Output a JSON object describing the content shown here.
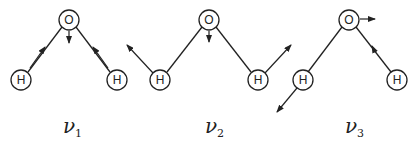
{
  "diagram": {
    "atoms": {
      "oxygen": "O",
      "hydrogen": "H"
    },
    "modes": [
      {
        "symbol": "ν",
        "subscript": "1",
        "name": "symmetric stretch"
      },
      {
        "symbol": "ν",
        "subscript": "2",
        "name": "bend"
      },
      {
        "symbol": "ν",
        "subscript": "3",
        "name": "asymmetric stretch"
      }
    ],
    "colors": {
      "line": "#222222",
      "background": "#ffffff"
    }
  }
}
